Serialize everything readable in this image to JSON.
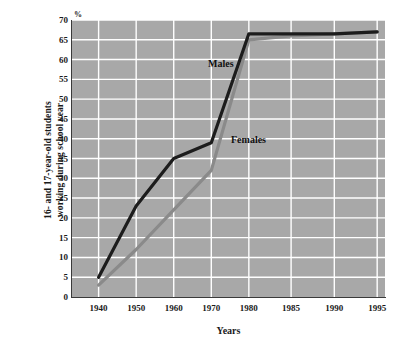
{
  "chart_data": {
    "type": "line",
    "title": "",
    "xlabel": "Years",
    "ylabel_line1": "16- and 17-year-old students",
    "ylabel_line2": "working during school year",
    "yunit": "%",
    "categories": [
      "1940",
      "1950",
      "1960",
      "1970",
      "1980",
      "1985",
      "1990",
      "1995"
    ],
    "x": [
      1940,
      1950,
      1960,
      1970,
      1980,
      1985,
      1990,
      1995
    ],
    "ylim": [
      0,
      70
    ],
    "yticks": [
      "0",
      "5",
      "10",
      "15",
      "20",
      "25",
      "30",
      "35",
      "40",
      "45",
      "50",
      "55",
      "60",
      "65",
      "70"
    ],
    "ytick_values": [
      0,
      5,
      10,
      15,
      20,
      25,
      30,
      35,
      40,
      45,
      50,
      55,
      60,
      65,
      70
    ],
    "grid": true,
    "grid_color": "#ffffff",
    "plot_background": "#a8a8a8",
    "legend_position": "inline-labels",
    "series": [
      {
        "name": "Males",
        "color": "#1c1c1c",
        "values": [
          5,
          23,
          35,
          39,
          66.5,
          66.5,
          66.5,
          67
        ]
      },
      {
        "name": "Females",
        "color": "#8a8a8a",
        "values": [
          3,
          12,
          22,
          32,
          65,
          66,
          66.5,
          67
        ]
      }
    ]
  },
  "axis": {
    "y_percent_symbol": "%",
    "x_axis_title": "Years",
    "y_axis_title_line1": "16- and 17-year-old students",
    "y_axis_title_line2": "working during school year"
  },
  "labels": {
    "males": "Males",
    "females": "Females"
  }
}
